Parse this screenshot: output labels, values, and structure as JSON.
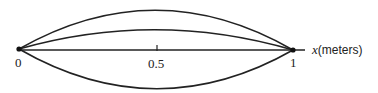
{
  "diagram": {
    "axis": {
      "var": "x",
      "unit": "(meters)"
    },
    "ticks": [
      {
        "label": "0",
        "value": 0
      },
      {
        "label": "0.5",
        "value": 0.5
      },
      {
        "label": "1",
        "value": 1
      }
    ],
    "curves": [
      {
        "name": "mode-1-upper",
        "peak": "large positive"
      },
      {
        "name": "mode-1-small",
        "peak": "small positive"
      },
      {
        "name": "equilibrium",
        "peak": "zero"
      },
      {
        "name": "mode-1-lower",
        "peak": "large negative"
      }
    ],
    "colors": {
      "line": "#222222",
      "background": "#ffffff"
    }
  }
}
